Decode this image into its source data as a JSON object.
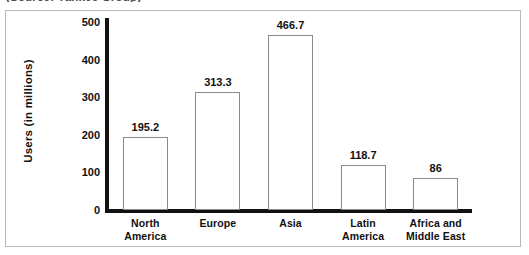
{
  "source_caption": "(Source: Yankee Group)",
  "chart_data": {
    "type": "bar",
    "title": "",
    "subtitle": "",
    "xlabel": "",
    "ylabel": "Users (in millions)",
    "categories": [
      "North America",
      "Europe",
      "Asia",
      "Latin America",
      "Africa and Middle East"
    ],
    "category_lines": [
      [
        "North",
        "America"
      ],
      [
        "Europe"
      ],
      [
        "Asia"
      ],
      [
        "Latin",
        "America"
      ],
      [
        "Africa and",
        "Middle East"
      ],
      []
    ],
    "values": [
      195.2,
      313.3,
      466.7,
      118.7,
      86
    ],
    "value_labels": [
      "195.2",
      "313.3",
      "466.7",
      "118.7",
      "86"
    ],
    "ylim": [
      0,
      500
    ],
    "yticks": [
      0,
      100,
      200,
      300,
      400,
      500
    ],
    "ytick_labels": [
      "0",
      "100",
      "200",
      "300",
      "400",
      "500"
    ],
    "grid": false,
    "legend": "none",
    "bar_fill_color": "#ffffff",
    "bar_edge_color": "#8a8a8a",
    "axis_color": "#111111",
    "frame_color": "#b8b8b8",
    "text_color": "#111111"
  }
}
